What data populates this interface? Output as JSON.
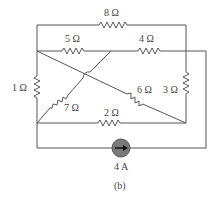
{
  "diagram": {
    "type": "circuit",
    "caption": "(b)",
    "resistors": [
      {
        "id": "r8",
        "label": "8 Ω",
        "value_ohms": 8
      },
      {
        "id": "r5",
        "label": "5 Ω",
        "value_ohms": 5
      },
      {
        "id": "r4",
        "label": "4 Ω",
        "value_ohms": 4
      },
      {
        "id": "r1",
        "label": "1 Ω",
        "value_ohms": 1
      },
      {
        "id": "r7",
        "label": "7 Ω",
        "value_ohms": 7
      },
      {
        "id": "r6",
        "label": "6 Ω",
        "value_ohms": 6
      },
      {
        "id": "r3",
        "label": "3 Ω",
        "value_ohms": 3
      },
      {
        "id": "r2",
        "label": "2 Ω",
        "value_ohms": 2
      }
    ],
    "source": {
      "type": "current-source",
      "label": "4 A",
      "value_amps": 4,
      "direction": "right"
    },
    "colors": {
      "wire": "#555555",
      "source_fill": "#7a7a7a",
      "background": "#ffffff"
    }
  }
}
